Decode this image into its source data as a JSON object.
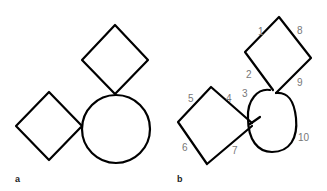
{
  "figure": {
    "panels": [
      {
        "id": "a",
        "label": "a",
        "description": "Two diamonds touching a circle (reference figure)"
      },
      {
        "id": "b",
        "label": "b",
        "description": "Hand-drawn copy with stroke order numbers"
      }
    ],
    "stroke_numbers": [
      "1",
      "2",
      "3",
      "4",
      "5",
      "6",
      "7",
      "8",
      "9",
      "10"
    ],
    "colors": {
      "stroke": "#000000",
      "numbers": "#777777",
      "background": "#ffffff"
    }
  }
}
